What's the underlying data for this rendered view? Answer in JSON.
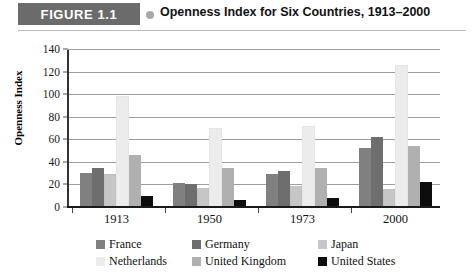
{
  "figure": {
    "badge": "FIGURE 1.1",
    "title": "Openness Index for Six Countries, 1913–2000",
    "dot_icon": "bullet-dot-icon"
  },
  "colors": {
    "badge_bg": "#6b6b6b",
    "france": "#808080",
    "germany": "#6e6e6e",
    "japan": "#c6c6c6",
    "netherlands": "#ececec",
    "united_kingdom": "#b0b0b0",
    "united_states": "#0d0d0d",
    "gridline": "#9d9d9d",
    "axis": "#1a1a1a"
  },
  "chart_data": {
    "type": "bar",
    "title": "Openness Index for Six Countries, 1913–2000",
    "xlabel": "",
    "ylabel": "Openness Index",
    "categories": [
      "1913",
      "1950",
      "1973",
      "2000"
    ],
    "ylim": [
      0,
      140
    ],
    "yticks": [
      0,
      20,
      40,
      60,
      80,
      100,
      120,
      140
    ],
    "grid": true,
    "legend_position": "bottom",
    "series": [
      {
        "name": "France",
        "color": "#808080",
        "values": [
          30,
          21,
          29,
          52
        ]
      },
      {
        "name": "Germany",
        "color": "#6e6e6e",
        "values": [
          35,
          20,
          32,
          62
        ]
      },
      {
        "name": "Japan",
        "color": "#c6c6c6",
        "values": [
          29,
          17,
          19,
          16
        ]
      },
      {
        "name": "Netherlands",
        "color": "#ececec",
        "values": [
          98,
          70,
          72,
          126
        ]
      },
      {
        "name": "United Kingdom",
        "color": "#b0b0b0",
        "values": [
          46,
          35,
          35,
          54
        ]
      },
      {
        "name": "United States",
        "color": "#0d0d0d",
        "values": [
          10,
          6,
          8,
          22
        ]
      }
    ]
  }
}
